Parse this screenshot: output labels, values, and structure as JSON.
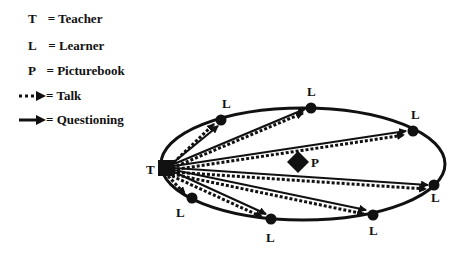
{
  "legend": {
    "items": [
      {
        "key": "T",
        "label": "= Teacher"
      },
      {
        "key": "L",
        "label": "= Learner"
      },
      {
        "key": "P",
        "label": "= Picturebook"
      },
      {
        "key": "dotted-arrow",
        "label": "= Talk"
      },
      {
        "key": "solid-arrow",
        "label": "= Questioning"
      }
    ]
  },
  "diagram": {
    "teacher_label": "T",
    "picturebook_label": "P",
    "learner_label": "L",
    "learners": [
      {
        "id": 1,
        "label": "L"
      },
      {
        "id": 2,
        "label": "L"
      },
      {
        "id": 3,
        "label": "L"
      },
      {
        "id": 4,
        "label": "L"
      },
      {
        "id": 5,
        "label": "L"
      },
      {
        "id": 6,
        "label": "L"
      },
      {
        "id": 7,
        "label": "L"
      }
    ]
  }
}
